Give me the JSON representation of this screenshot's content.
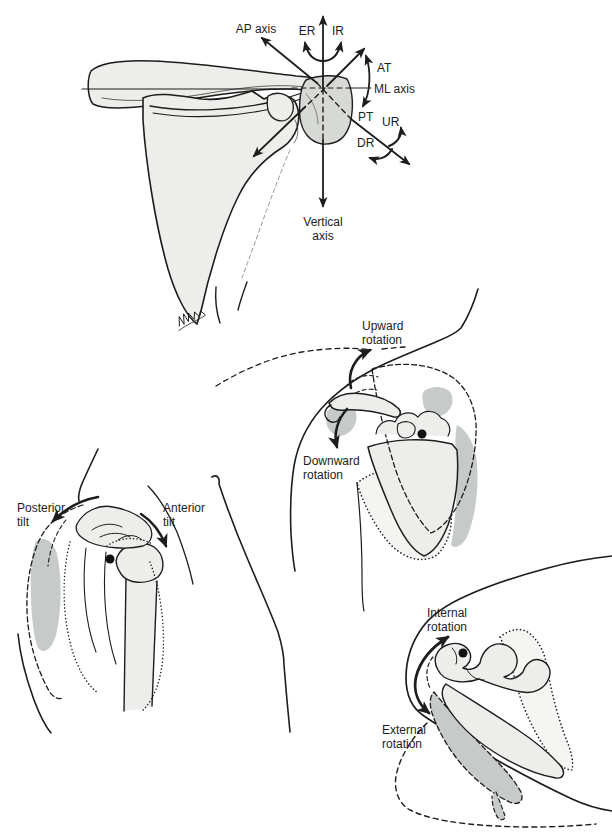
{
  "colors": {
    "ink": "#1d1d1b",
    "bone_fill": "#ededeb",
    "acromion_fill": "#d7d9d7",
    "shade_fill": "#c6cac8",
    "pivot_dot": "#111111",
    "background": "#ffffff"
  },
  "panels": {
    "axes": {
      "labels": {
        "ap_axis": "AP axis",
        "er": "ER",
        "ir": "IR",
        "at": "AT",
        "ml_axis": "ML axis",
        "pt": "PT",
        "ur": "UR",
        "dr": "DR",
        "vertical_axis": [
          "Vertical",
          "axis"
        ]
      }
    },
    "upward_downward": {
      "labels": {
        "upward": [
          "Upward",
          "rotation"
        ],
        "downward": [
          "Downward",
          "rotation"
        ]
      }
    },
    "tilt": {
      "labels": {
        "posterior": [
          "Posterior",
          "tilt"
        ],
        "anterior": [
          "Anterior",
          "tilt"
        ]
      }
    },
    "internal_external": {
      "labels": {
        "internal": [
          "Internal",
          "rotation"
        ],
        "external": [
          "External",
          "rotation"
        ]
      }
    }
  }
}
